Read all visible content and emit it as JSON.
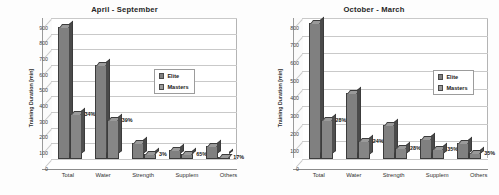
{
  "chart_data": [
    {
      "type": "bar",
      "title": "April - September",
      "ylabel": "Training Duration [min]",
      "xlabel": "",
      "ylim": [
        0,
        900
      ],
      "yticks": [
        0,
        100,
        200,
        300,
        400,
        500,
        600,
        700,
        800,
        900
      ],
      "grid": true,
      "legend_position": "center",
      "categories": [
        "Total",
        "Water",
        "Strength",
        "Supplem",
        "Others"
      ],
      "series": [
        {
          "name": "Elite",
          "values": [
            845,
            600,
            100,
            55,
            85
          ]
        },
        {
          "name": "Masters",
          "values": [
            290,
            250,
            30,
            35,
            15
          ]
        }
      ],
      "annotations": [
        "34%",
        "39%",
        "3%",
        "65%",
        "17%"
      ]
    },
    {
      "type": "bar",
      "title": "October - March",
      "ylabel": "Training Duration [min]",
      "xlabel": "",
      "ylim": [
        0,
        800
      ],
      "yticks": [
        0,
        100,
        200,
        300,
        400,
        500,
        600,
        700,
        800
      ],
      "grid": true,
      "legend_position": "center",
      "categories": [
        "Total",
        "Water",
        "Strength",
        "Supplem",
        "Others"
      ],
      "series": [
        {
          "name": "Elite",
          "values": [
            770,
            375,
            195,
            115,
            90
          ]
        },
        {
          "name": "Masters",
          "values": [
            220,
            105,
            65,
            55,
            35
          ]
        }
      ],
      "annotations": [
        "28%",
        "24%",
        "28%",
        "35%",
        "35%"
      ]
    }
  ],
  "panels": [
    {
      "title": "April - September",
      "ylabel": "Training Duration [min]",
      "ymax": 900,
      "yticks": [
        "900",
        "800",
        "700",
        "600",
        "500",
        "400",
        "300",
        "200",
        "100",
        "0"
      ],
      "legend": [
        {
          "label": "Elite",
          "color": "#808080"
        },
        {
          "label": "Masters",
          "color": "#9a9a9a"
        }
      ],
      "categories": [
        {
          "label": "Total",
          "elite": 845,
          "masters": 290,
          "pct": "34%"
        },
        {
          "label": "Water",
          "elite": 600,
          "masters": 250,
          "pct": "39%"
        },
        {
          "label": "Strength",
          "elite": 100,
          "masters": 30,
          "pct": "3%"
        },
        {
          "label": "Supplem",
          "elite": 55,
          "masters": 35,
          "pct": "65%"
        },
        {
          "label": "Others",
          "elite": 85,
          "masters": 15,
          "pct": "17%"
        }
      ]
    },
    {
      "title": "October - March",
      "ylabel": "Training Duration [min]",
      "ymax": 800,
      "yticks": [
        "800",
        "700",
        "600",
        "500",
        "400",
        "300",
        "200",
        "100",
        "0"
      ],
      "legend": [
        {
          "label": "Elite",
          "color": "#808080"
        },
        {
          "label": "Masters",
          "color": "#9a9a9a"
        }
      ],
      "categories": [
        {
          "label": "Total",
          "elite": 770,
          "masters": 220,
          "pct": "28%"
        },
        {
          "label": "Water",
          "elite": 375,
          "masters": 105,
          "pct": "24%"
        },
        {
          "label": "Strength",
          "elite": 195,
          "masters": 65,
          "pct": "28%"
        },
        {
          "label": "Supplem",
          "elite": 115,
          "masters": 55,
          "pct": "35%"
        },
        {
          "label": "Others",
          "elite": 90,
          "masters": 35,
          "pct": "35%"
        }
      ]
    }
  ]
}
